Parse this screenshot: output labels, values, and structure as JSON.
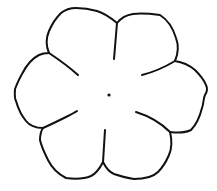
{
  "image": {
    "subject": "Six-petal flower outline",
    "background_color": "#ffffff",
    "stroke_color": "#111111",
    "stroke_width": 2
  },
  "flower": {
    "petal_count": 6,
    "center": {
      "x": 109,
      "y": 95,
      "radius": 1.6
    },
    "outline_path": "M117,23 C121,18 126,15 133,14 C142,13 152,14 160,15 C168,20 173,28 176,38 C179,46 178,54 175,61 C182,62 189,65 195,70 C200,75 204,80 206,85 C208,89 207,92 205,95 C203,99 204,103 202,108 C200,116 196,125 191,130 C185,133 178,133 170,132 C172,140 172,148 169,155 C166,162 162,168 158,172 C152,178 143,179 134,179 C127,178 120,176 114,174 C109,172 106,168 103,162 C100,168 97,173 91,176 C84,179 74,179 66,178 C58,174 52,168 48,160 C44,152 41,145 40,140 C40,135 41,131 43,128 C36,128 30,126 26,121 C21,115 18,108 16,101 C14,97 15,92 15,89 C17,84 19,79 22,74 C27,64 33,58 39,55 C43,53 46,53 49,53 C46,46 46,38 49,31 C52,24 56,18 61,13 C66,9 71,8 76,8 C83,8 90,9 97,11 C104,13 111,18 117,23 Z",
    "veins": [
      {
        "name": "top",
        "path": "M117,23 L114,59"
      },
      {
        "name": "upper-left",
        "path": "M49,53 C58,59 68,66 78,75"
      },
      {
        "name": "upper-right",
        "path": "M175,61 C165,67 154,72 142,75"
      },
      {
        "name": "lower-left",
        "path": "M43,128 C52,124 60,120 66,117 C70,115 74,113 77,111"
      },
      {
        "name": "lower-right",
        "path": "M170,132 C162,124 152,117 136,112"
      },
      {
        "name": "bottom",
        "path": "M105,130 L103,162"
      }
    ]
  }
}
